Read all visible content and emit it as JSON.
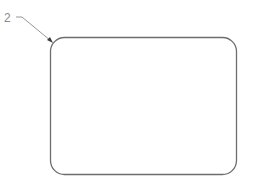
{
  "diagram": {
    "callout": {
      "label": "2"
    },
    "shape": {
      "type": "rounded-rectangle",
      "stroke": "#6e6e6e",
      "fill": "#ffffff"
    },
    "leader_color": "#8a8a8a"
  }
}
